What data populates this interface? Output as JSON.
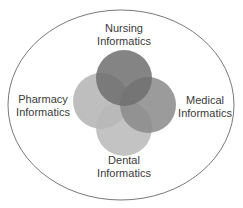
{
  "diagram": {
    "type": "venn",
    "outer_boundary": {
      "shape": "ellipse",
      "stroke": "#555555",
      "fill": "#ffffff"
    },
    "sets": [
      {
        "id": "nursing",
        "line1": "Nursing",
        "line2": "Informatics",
        "fill": "#6e6e6e",
        "opacity": 0.85,
        "position": "top"
      },
      {
        "id": "pharmacy",
        "line1": "Pharmacy",
        "line2": "Informatics",
        "fill": "#b3b3b3",
        "opacity": 0.85,
        "position": "left"
      },
      {
        "id": "medical",
        "line1": "Medical",
        "line2": "Informatics",
        "fill": "#8a8a8a",
        "opacity": 0.85,
        "position": "right"
      },
      {
        "id": "dental",
        "line1": "Dental",
        "line2": "Informatics",
        "fill": "#b8b8b8",
        "opacity": 0.85,
        "position": "bottom"
      }
    ]
  }
}
